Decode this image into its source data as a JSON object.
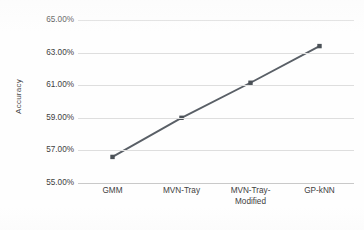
{
  "chart_data": {
    "type": "line",
    "title": "",
    "xlabel": "",
    "ylabel": "Accuracy",
    "categories": [
      "GMM",
      "MVN-Tray",
      "MVN-Tray-Modified",
      "GP-kNN"
    ],
    "category_lines": [
      [
        "GMM"
      ],
      [
        "MVN-Tray"
      ],
      [
        "MVN-Tray-",
        "Modified"
      ],
      [
        "GP-kNN"
      ]
    ],
    "values": [
      56.6,
      59.0,
      61.15,
      63.4
    ],
    "value_labels": [
      "56.60%",
      "59.00%",
      "61.15%",
      "63.40%"
    ],
    "ylim": [
      55.0,
      65.0
    ],
    "ytick_values": [
      65.0,
      63.0,
      61.0,
      59.0,
      57.0,
      55.0
    ],
    "ytick_labels": [
      "65.00%",
      "63.00%",
      "61.00%",
      "59.00%",
      "57.00%",
      "55.00%"
    ],
    "grid": true,
    "legend": false,
    "legend_position": "none",
    "series": [
      {
        "name": "Accuracy",
        "values": [
          56.6,
          59.0,
          61.15,
          63.4
        ],
        "line_color": "#595f66",
        "marker_color": "#4b5157",
        "marker": "square"
      }
    ],
    "colors": {
      "line": "#595f66",
      "marker": "#4b5157",
      "gridline": "#dedede",
      "baseline": "#c9c9c9",
      "text": "#404040",
      "background": "#ffffff"
    }
  }
}
